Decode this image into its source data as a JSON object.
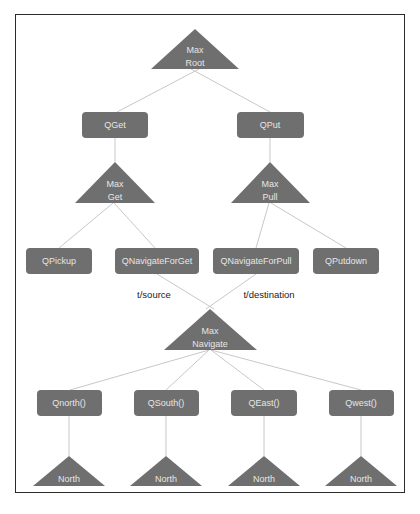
{
  "diagram": {
    "type": "MAXQ task hierarchy",
    "colors": {
      "node_fill": "#6f6f6f",
      "node_text": "#e6e6e6",
      "edge": "#c8c8c8",
      "frame_border": "#2b2b2b",
      "edge_label_text": "#222222"
    },
    "max_nodes": {
      "root": {
        "line1": "Max",
        "line2": "Root"
      },
      "get": {
        "line1": "Max",
        "line2": "Get"
      },
      "pull": {
        "line1": "Max",
        "line2": "Pull"
      },
      "navigate": {
        "line1": "Max",
        "line2": "Navigate"
      }
    },
    "q_nodes": {
      "qget": "QGet",
      "qput": "QPut",
      "qpickup": "QPickup",
      "qnavigateforget": "QNavigateForGet",
      "qnavigateforpull": "QNavigateForPull",
      "qputdown": "QPutdown",
      "qnorth": "Qnorth()",
      "qsouth": "QSouth()",
      "qeast": "QEast()",
      "qwest": "Qwest()"
    },
    "leaf_nodes": [
      "North",
      "North",
      "North",
      "North"
    ],
    "edge_labels": {
      "source": "t/source",
      "destination": "t/destination"
    },
    "edges": [
      [
        "Max Root",
        "QGet"
      ],
      [
        "Max Root",
        "QPut"
      ],
      [
        "QGet",
        "Max Get"
      ],
      [
        "QPut",
        "Max Pull"
      ],
      [
        "Max Get",
        "QPickup"
      ],
      [
        "Max Get",
        "QNavigateForGet"
      ],
      [
        "Max Pull",
        "QNavigateForPull"
      ],
      [
        "Max Pull",
        "QPutdown"
      ],
      [
        "QNavigateForGet",
        "Max Navigate"
      ],
      [
        "QNavigateForPull",
        "Max Navigate"
      ],
      [
        "Max Navigate",
        "Qnorth()"
      ],
      [
        "Max Navigate",
        "QSouth()"
      ],
      [
        "Max Navigate",
        "QEast()"
      ],
      [
        "Max Navigate",
        "Qwest()"
      ],
      [
        "Qnorth()",
        "North"
      ],
      [
        "QSouth()",
        "North"
      ],
      [
        "QEast()",
        "North"
      ],
      [
        "Qwest()",
        "North"
      ]
    ]
  }
}
